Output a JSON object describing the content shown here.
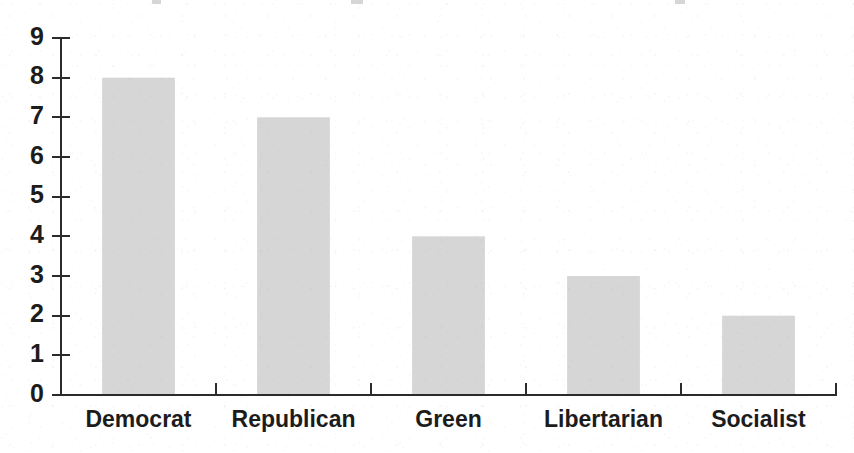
{
  "chart_data": {
    "type": "bar",
    "title": "",
    "subtitle": "",
    "xlabel": "",
    "ylabel": "",
    "categories": [
      "Democrat",
      "Republican",
      "Green",
      "Libertarian",
      "Socialist"
    ],
    "values": [
      8,
      7,
      4,
      3,
      2
    ],
    "ylim": [
      0,
      9
    ],
    "y_ticks": [
      0,
      1,
      2,
      3,
      4,
      5,
      6,
      7,
      8,
      9
    ],
    "y_tick_labels": [
      "0",
      "1",
      "2",
      "3",
      "4",
      "5",
      "6",
      "7",
      "8",
      "9"
    ],
    "grid": false,
    "legend": null,
    "legend_position": "none",
    "annotations": [],
    "series": [
      {
        "name": "Count",
        "values": [
          8,
          7,
          4,
          3,
          2
        ]
      }
    ]
  },
  "style": {
    "bar_fill": "#d6d6d6",
    "axis_color": "#2b2b2b",
    "text_color": "#1c1c1c",
    "background": "#ffffff"
  }
}
